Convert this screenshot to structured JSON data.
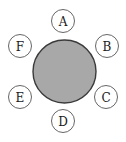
{
  "diagram": {
    "center": {
      "name": "table",
      "cx": 64.5,
      "cy": 71.5,
      "r": 31.5,
      "fill": "#a8a8a8",
      "stroke": "#3a3a3a"
    },
    "seats": [
      {
        "label": "A",
        "cx": 63,
        "cy": 21
      },
      {
        "label": "B",
        "cx": 107,
        "cy": 46
      },
      {
        "label": "C",
        "cx": 106,
        "cy": 97
      },
      {
        "label": "D",
        "cx": 63,
        "cy": 121
      },
      {
        "label": "E",
        "cx": 20,
        "cy": 97
      },
      {
        "label": "F",
        "cx": 20,
        "cy": 46
      }
    ],
    "seat_radius": 11.5
  }
}
